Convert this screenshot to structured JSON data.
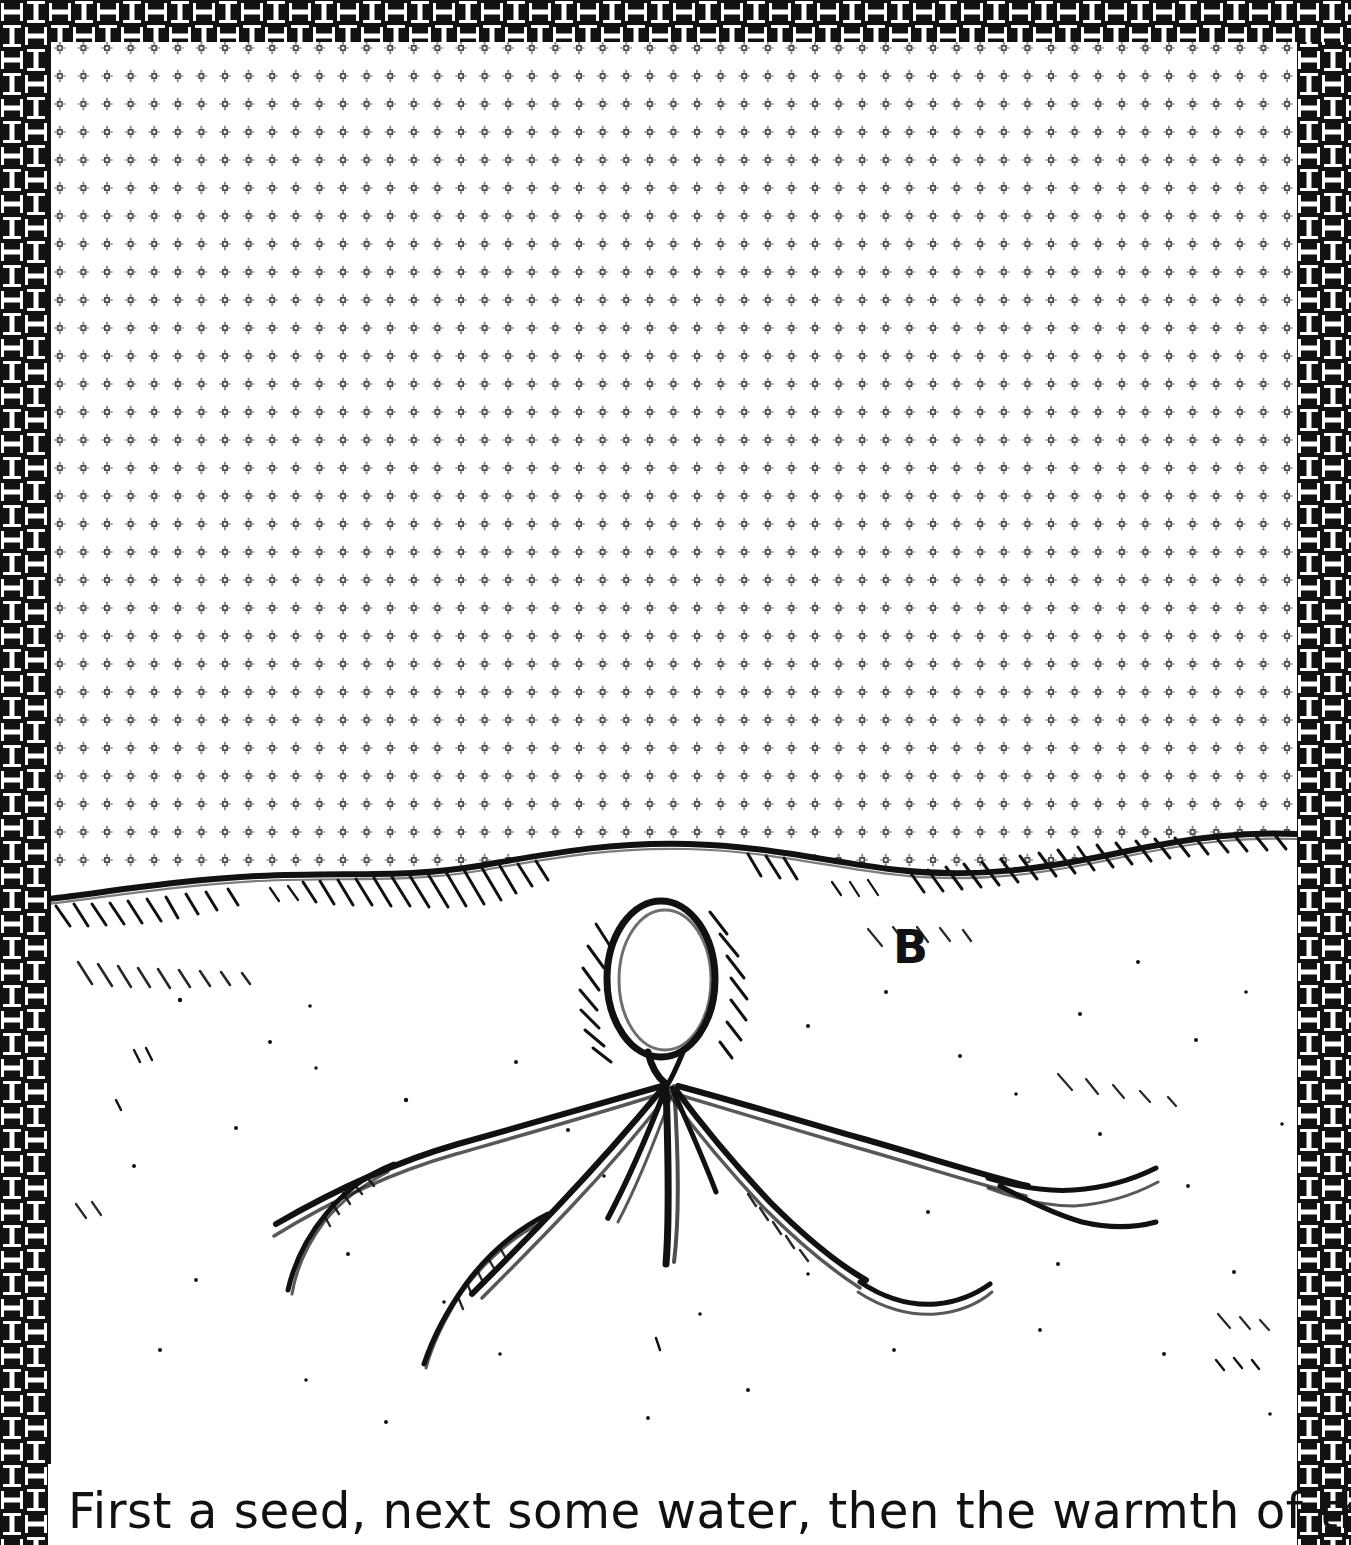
{
  "page": {
    "kind": "illustrated-storybook-page",
    "background_color": "#ffffff",
    "ink_color": "#111111"
  },
  "border": {
    "name": "interlocking-key-weave-border",
    "pattern": "basket-weave-greek-key",
    "color": "#111111",
    "background": "#ffffff",
    "tile_size_px": 48,
    "sides": [
      "left",
      "top",
      "right"
    ]
  },
  "illustration": {
    "title": "seed germinating underground",
    "sky": {
      "name": "dotted-sky-region",
      "fill": "#ffffff",
      "dot_glyph": "small-square-with-ticks",
      "dot_color": "#555555",
      "dot_spacing_x_px": 23.6,
      "dot_spacing_y_px": 28.0
    },
    "ground": {
      "name": "ground-line",
      "style": "undulating-hand-drawn-line-with-hatching",
      "color": "#111111"
    },
    "seed": {
      "name": "seed",
      "shape": "oval",
      "state": "buried just below surface",
      "color": "#111111"
    },
    "roots": {
      "name": "root-system",
      "branch_count": 6,
      "description": "roots radiating downward and outward from base of seed",
      "color": "#111111"
    },
    "label": {
      "name": "panel-label",
      "text": "B"
    }
  },
  "caption": {
    "name": "story-caption",
    "text": "First a seed, next some water, then the warmth of the sun;"
  }
}
